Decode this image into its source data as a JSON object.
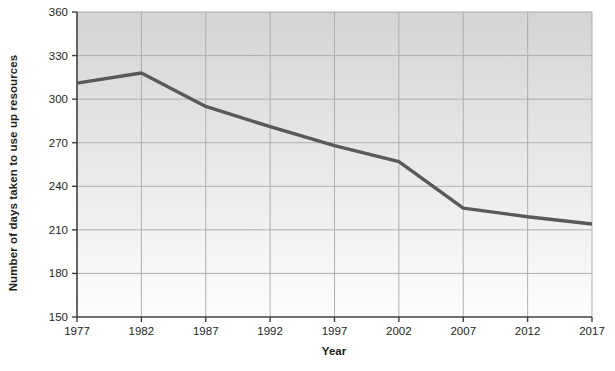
{
  "chart_data": {
    "type": "line",
    "title": "",
    "xlabel": "Year",
    "ylabel": "Number of days taken to use up resources",
    "x": [
      1977,
      1982,
      1987,
      1992,
      1997,
      2002,
      2007,
      2012,
      2017
    ],
    "values": [
      311,
      318,
      295,
      281,
      268,
      257,
      225,
      219,
      214
    ],
    "series": [
      {
        "name": "Number of days taken to use up resources",
        "values": [
          311,
          318,
          295,
          281,
          268,
          257,
          225,
          219,
          214
        ]
      }
    ],
    "xtick_labels": [
      "1977",
      "1982",
      "1987",
      "1992",
      "1997",
      "2002",
      "2007",
      "2012",
      "2017"
    ],
    "ytick_labels": [
      "150",
      "180",
      "210",
      "240",
      "270",
      "300",
      "330",
      "360"
    ],
    "yticks": [
      150,
      180,
      210,
      240,
      270,
      300,
      330,
      360
    ],
    "xlim": [
      1977,
      2017
    ],
    "ylim": [
      150,
      360
    ],
    "grid": true,
    "legend": "none",
    "line_color": "#595959",
    "plot_bg_top_color": "#d4d4d4",
    "plot_bg_bottom_color": "#fdfdfd",
    "grid_color": "#a8a8a8",
    "axis_color": "#404040",
    "text_color": "#231f20"
  }
}
